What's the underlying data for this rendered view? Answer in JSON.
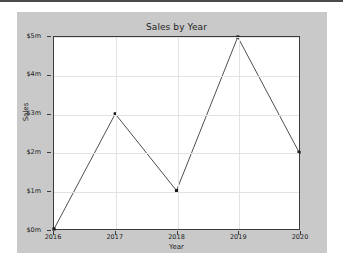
{
  "chart_data": {
    "type": "line",
    "title": "Sales by Year",
    "xlabel": "Year",
    "ylabel": "Sales",
    "categories": [
      "2016",
      "2017",
      "2018",
      "2019",
      "2020"
    ],
    "x": [
      2016,
      2017,
      2018,
      2019,
      2020
    ],
    "values": [
      0,
      3000000,
      1000000,
      5000000,
      2000000
    ],
    "values_display": [
      "$0m",
      "$3m",
      "$1m",
      "$5m",
      "$2m"
    ],
    "series": [
      {
        "name": "Sales",
        "values": [
          0,
          3000000,
          1000000,
          5000000,
          2000000
        ]
      }
    ],
    "xlim": [
      2016,
      2020
    ],
    "ylim": [
      0,
      5000000
    ],
    "ytick_labels": [
      "$0m",
      "$1m",
      "$2m",
      "$3m",
      "$4m",
      "$5m"
    ],
    "ytick_values": [
      0,
      1000000,
      2000000,
      3000000,
      4000000,
      5000000
    ],
    "xtick_labels": [
      "2016",
      "2017",
      "2018",
      "2019",
      "2020"
    ],
    "grid": true,
    "legend": false,
    "marker": "square",
    "line_color": "#4d4d4d",
    "marker_color": "#1a1a1a",
    "grid_color": "#e2e2e2",
    "axes_color": "#3c3c3c",
    "figure_background": "#c9c9c9",
    "plot_background": "#ffffff"
  }
}
